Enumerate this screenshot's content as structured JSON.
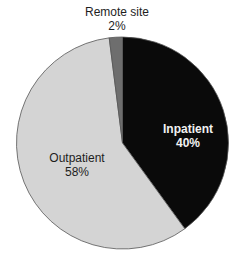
{
  "chart_data": {
    "type": "pie",
    "title": "",
    "start_angle_deg": 0,
    "direction": "clockwise",
    "slices": [
      {
        "label": "Inpatient",
        "value": 40,
        "display": "40%",
        "color": "#0a0a0a"
      },
      {
        "label": "Outpatient",
        "value": 58,
        "display": "58%",
        "color": "#d4d4d4"
      },
      {
        "label": "Remote site",
        "value": 2,
        "display": "2%",
        "color": "#6e6e6e"
      }
    ],
    "legend": "none",
    "labels_on_slices": true
  },
  "labels": {
    "remote": {
      "name": "Remote site",
      "pct": "2%"
    },
    "inpatient": {
      "name": "Inpatient",
      "pct": "40%"
    },
    "outpatient": {
      "name": "Outpatient",
      "pct": "58%"
    }
  }
}
